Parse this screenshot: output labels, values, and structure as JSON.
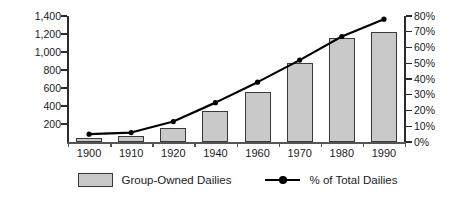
{
  "chart_data": {
    "type": "bar",
    "title": "",
    "subtitle": "",
    "xlabel": "",
    "ylabel": "",
    "categories": [
      "1900",
      "1910",
      "1920",
      "1940",
      "1960",
      "1970",
      "1980",
      "1990"
    ],
    "series": [
      {
        "name": "Group-Owned Dailies",
        "type": "bar",
        "axis": "left",
        "color": "#c9c9c9",
        "edge_color": "#3a3a3a",
        "values": [
          50,
          62,
          160,
          350,
          560,
          880,
          1160,
          1220
        ]
      },
      {
        "name": "% of Total Dailies",
        "type": "line",
        "axis": "right",
        "color": "#000000",
        "marker": "circle",
        "values": [
          5,
          6,
          13,
          25,
          38,
          52,
          67,
          78
        ]
      }
    ],
    "left_axis": {
      "label": "",
      "ylim": [
        0,
        1400
      ],
      "ticks": [
        200,
        400,
        600,
        800,
        1000,
        1200,
        1400
      ],
      "tick_labels": [
        "200",
        "400",
        "600",
        "800",
        "1,000",
        "1,200",
        "1,400"
      ]
    },
    "right_axis": {
      "label": "",
      "ylim": [
        0,
        80
      ],
      "ticks": [
        0,
        10,
        20,
        30,
        40,
        50,
        60,
        70,
        80
      ],
      "tick_labels": [
        "0%",
        "10%",
        "20%",
        "30%",
        "40%",
        "50%",
        "60%",
        "70%",
        "80%"
      ]
    },
    "grid": false,
    "legend_position": "bottom-center",
    "legend": [
      {
        "label": "Group-Owned Dailies",
        "marker": "swatch"
      },
      {
        "label": "% of Total Dailies",
        "marker": "line-point"
      }
    ]
  }
}
